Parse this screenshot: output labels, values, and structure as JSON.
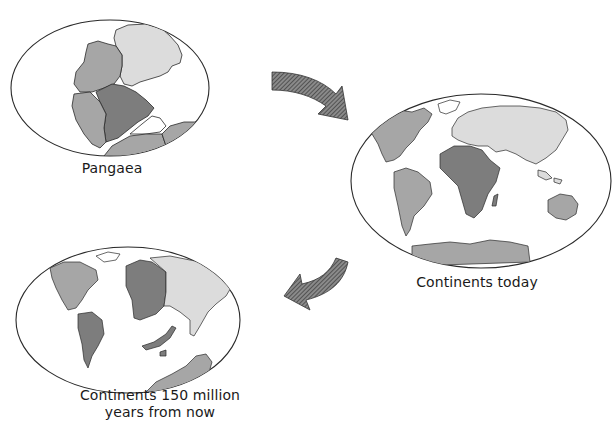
{
  "colors": {
    "outline": "#2a2a2a",
    "continent_dark": "#7d7d7d",
    "continent_medium": "#a6a6a6",
    "continent_light": "#dcdcdc",
    "arrow_fill": "#6e6e6e",
    "background": "#ffffff"
  },
  "panels": [
    {
      "id": "pangaea",
      "caption": "Pangaea",
      "description": "Single supercontinent in an oval world map"
    },
    {
      "id": "today",
      "caption": "Continents today",
      "description": "Present-day world map with continents shaded"
    },
    {
      "id": "future",
      "caption_line1": "Continents 150 million",
      "caption_line2": "years from now",
      "description": "Predicted future arrangement of continents"
    }
  ],
  "arrows": [
    {
      "from": "pangaea",
      "to": "today",
      "icon": "curved-arrow-right-down"
    },
    {
      "from": "today",
      "to": "future",
      "icon": "curved-arrow-left-down"
    }
  ]
}
